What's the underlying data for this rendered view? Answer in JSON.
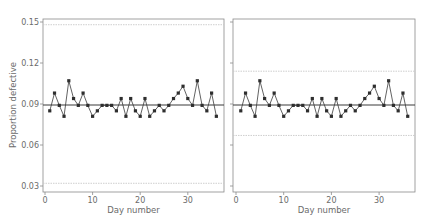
{
  "chart_data": [
    {
      "type": "line",
      "title": "",
      "xlabel": "Day number",
      "ylabel": "Proportion defective",
      "xlim": [
        0,
        37
      ],
      "ylim": [
        0.029,
        0.152
      ],
      "xticks": [
        0,
        10,
        20,
        30
      ],
      "yticks": [
        0.03,
        0.06,
        0.09,
        0.12,
        0.15
      ],
      "ytick_labels": [
        "0.03",
        "0.06",
        "0.09",
        "0.12",
        "0.15"
      ],
      "xtick_labels": [
        "0",
        "10",
        "20",
        "30"
      ],
      "grid": false,
      "center_line": 0.0893,
      "upper_limit": 0.148,
      "lower_limit": 0.032,
      "x": [
        1,
        2,
        3,
        4,
        5,
        6,
        7,
        8,
        9,
        10,
        11,
        12,
        13,
        14,
        15,
        16,
        17,
        18,
        19,
        20,
        21,
        22,
        23,
        24,
        25,
        26,
        27,
        28,
        29,
        30,
        31,
        32,
        33,
        34,
        35,
        36
      ],
      "values": [
        0.085,
        0.098,
        0.089,
        0.081,
        0.107,
        0.094,
        0.089,
        0.098,
        0.089,
        0.081,
        0.085,
        0.089,
        0.089,
        0.089,
        0.085,
        0.094,
        0.081,
        0.094,
        0.085,
        0.081,
        0.094,
        0.081,
        0.085,
        0.089,
        0.085,
        0.089,
        0.094,
        0.098,
        0.103,
        0.094,
        0.089,
        0.107,
        0.089,
        0.085,
        0.098,
        0.081
      ]
    },
    {
      "type": "line",
      "title": "",
      "xlabel": "Day number",
      "ylabel": "",
      "xlim": [
        0,
        37
      ],
      "ylim": [
        0.029,
        0.152
      ],
      "xticks": [
        0,
        10,
        20,
        30
      ],
      "yticks": [
        0.03,
        0.06,
        0.09,
        0.12,
        0.15
      ],
      "xtick_labels": [
        "0",
        "10",
        "20",
        "30"
      ],
      "grid": false,
      "center_line": 0.0893,
      "upper_limit": 0.114,
      "lower_limit": 0.067,
      "x": [
        1,
        2,
        3,
        4,
        5,
        6,
        7,
        8,
        9,
        10,
        11,
        12,
        13,
        14,
        15,
        16,
        17,
        18,
        19,
        20,
        21,
        22,
        23,
        24,
        25,
        26,
        27,
        28,
        29,
        30,
        31,
        32,
        33,
        34,
        35,
        36
      ],
      "values": [
        0.085,
        0.098,
        0.089,
        0.081,
        0.107,
        0.094,
        0.089,
        0.098,
        0.089,
        0.081,
        0.085,
        0.089,
        0.089,
        0.089,
        0.085,
        0.094,
        0.081,
        0.094,
        0.085,
        0.081,
        0.094,
        0.081,
        0.085,
        0.089,
        0.085,
        0.089,
        0.094,
        0.098,
        0.103,
        0.094,
        0.089,
        0.107,
        0.089,
        0.085,
        0.098,
        0.081
      ]
    }
  ],
  "colors": {
    "line": "#3a3a3a",
    "marker": "#2e2e2e",
    "center_line": "#3a3a3a",
    "limit_line": "#c8c8c8",
    "frame": "#8a8a8a",
    "text": "#6b6b6b"
  }
}
